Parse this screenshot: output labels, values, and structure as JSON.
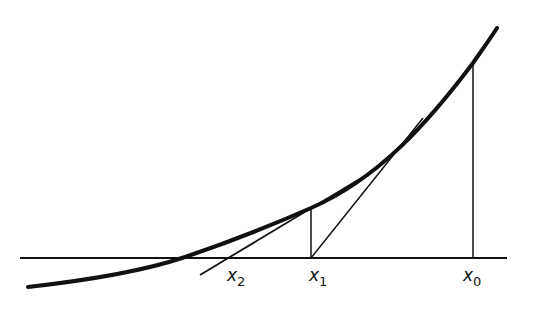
{
  "figure": {
    "colors": {
      "ink": "#111111",
      "background": "#ffffff"
    },
    "axis": {
      "x1": 20,
      "x2": 507,
      "y": 258
    },
    "curve_path": "M 28 287 C 90 280, 140 272, 182 258 C 230 242, 270 226, 311 208 C 380 178, 430 120, 473 63 C 482 50, 490 39, 497 28",
    "verticals": [
      {
        "name": "x0-ordinate",
        "x": 473,
        "y_top": 63,
        "y_bottom": 258
      },
      {
        "name": "x1-ordinate",
        "x": 311,
        "y_top": 208,
        "y_bottom": 258
      }
    ],
    "tangents": [
      {
        "name": "tangent-at-x0",
        "x1": 423,
        "y1": 118,
        "x2": 311,
        "y2": 258
      },
      {
        "name": "tangent-at-x1",
        "x1": 378,
        "y1": 168,
        "x2": 200,
        "y2": 275
      }
    ],
    "labels": [
      {
        "name": "label-x2",
        "main": "x",
        "sub": "2",
        "x": 227,
        "y": 281
      },
      {
        "name": "label-x1",
        "main": "x",
        "sub": "1",
        "x": 309,
        "y": 281
      },
      {
        "name": "label-x0",
        "main": "x",
        "sub": "0",
        "x": 463,
        "y": 281
      }
    ]
  }
}
